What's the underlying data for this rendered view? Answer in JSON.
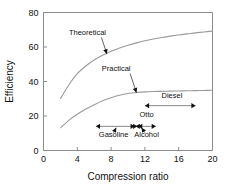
{
  "chart_data": {
    "type": "line",
    "title": "",
    "xlabel": "Compression ratio",
    "ylabel": "Efficiency",
    "xlim": [
      0,
      20
    ],
    "ylim": [
      0,
      80
    ],
    "xticks": [
      "0",
      "4",
      "8",
      "12",
      "16",
      "20"
    ],
    "yticks": [
      "0",
      "20",
      "40",
      "60",
      "80"
    ],
    "grid": false,
    "legend": "none",
    "series": [
      {
        "name": "Theoretical",
        "x": [
          2,
          3,
          4,
          5,
          6,
          7,
          8,
          9,
          10,
          11,
          12,
          13,
          14,
          15,
          16,
          17,
          18,
          19,
          20
        ],
        "y": [
          30.0,
          38.0,
          44.5,
          49.0,
          52.5,
          55.2,
          57.5,
          59.4,
          61.0,
          62.4,
          63.6,
          64.6,
          65.5,
          66.3,
          67.0,
          67.6,
          68.2,
          68.7,
          69.2
        ]
      },
      {
        "name": "Practical",
        "x": [
          2,
          3,
          4,
          5,
          6,
          7,
          8,
          9,
          10,
          11,
          12,
          13,
          14,
          15,
          16,
          17,
          18,
          19,
          20
        ],
        "y": [
          13.0,
          17.5,
          21.0,
          24.0,
          26.5,
          28.8,
          30.6,
          32.0,
          33.0,
          33.6,
          34.0,
          34.2,
          34.3,
          34.4,
          34.5,
          34.6,
          34.7,
          34.8,
          34.9
        ]
      }
    ],
    "annotations": [
      {
        "label": "Theoretical",
        "text_x": 5.2,
        "text_y": 67.0,
        "point_x": 7.5,
        "point_y": 56.0
      },
      {
        "label": "Practical",
        "text_x": 8.6,
        "text_y": 46.0,
        "point_x": 11.0,
        "point_y": 33.5
      }
    ],
    "ranges": [
      {
        "label": "Otto",
        "x_start": 11.2,
        "x_end": 13.3,
        "y": 14.0,
        "label_x": 12.2,
        "label_y": 19.5,
        "label_pos": "above"
      },
      {
        "label": "Gasoline",
        "x_start": 6.2,
        "x_end": 10.8,
        "y": 14.0,
        "label_x": 8.3,
        "label_y": 8.0,
        "label_pos": "below"
      },
      {
        "label": "Alcohol",
        "x_start": 10.9,
        "x_end": 11.1,
        "y": 14.0,
        "label_x": 12.2,
        "label_y": 8.0,
        "label_pos": "below"
      },
      {
        "label": "Diesel",
        "x_start": 12.0,
        "x_end": 18.0,
        "y": 26.0,
        "label_x": 15.2,
        "label_y": 30.5,
        "label_pos": "above"
      }
    ],
    "leaders": [
      {
        "name": "gasoline-leader",
        "from_x": 8.3,
        "from_y": 10.3,
        "to_x": 8.6,
        "to_y": 13.2
      },
      {
        "name": "alcohol-leader",
        "from_x": 12.0,
        "from_y": 10.3,
        "to_x": 11.6,
        "to_y": 13.2
      }
    ]
  }
}
